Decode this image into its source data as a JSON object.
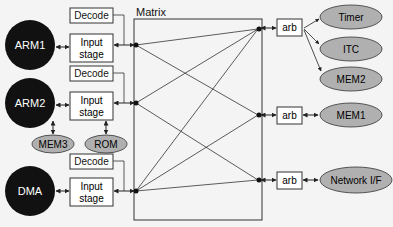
{
  "matrix": {
    "label": "Matrix"
  },
  "masters": [
    {
      "id": "arm1",
      "label": "ARM1"
    },
    {
      "id": "arm2",
      "label": "ARM2"
    },
    {
      "id": "dma",
      "label": "DMA"
    }
  ],
  "decode": [
    "Decode",
    "Decode",
    "Decode"
  ],
  "input_stage": [
    {
      "line1": "Input",
      "line2": "stage"
    },
    {
      "line1": "Input",
      "line2": "stage"
    },
    {
      "line1": "Input",
      "line2": "stage"
    }
  ],
  "local_memories": [
    "MEM3",
    "ROM"
  ],
  "arbiters": [
    "arb",
    "arb",
    "arb"
  ],
  "slaves": [
    "Timer",
    "ITC",
    "MEM2",
    "MEM1",
    "Network I/F"
  ],
  "colors": {
    "master_fill": "#111111",
    "slave_fill": "#b0b0b0",
    "line": "#222222",
    "box_fill": "#ffffff"
  }
}
